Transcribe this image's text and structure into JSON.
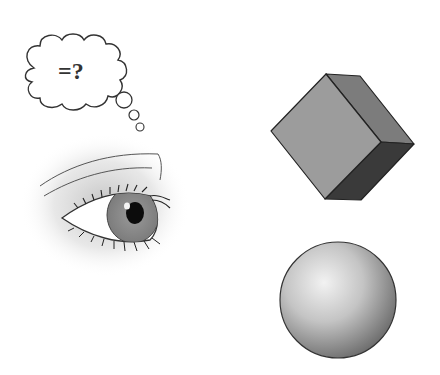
{
  "thought_bubble": {
    "text": "=?"
  },
  "figures": {
    "eye": {
      "description": "eye"
    },
    "cube": {
      "description": "cube",
      "colors": {
        "front": "#9a9a9a",
        "side": "#7a7a7a",
        "bottom": "#3a3a3a"
      }
    },
    "sphere": {
      "description": "sphere",
      "colors": {
        "highlight": "#f0f0f0",
        "shadow": "#6a6a6a"
      }
    }
  }
}
